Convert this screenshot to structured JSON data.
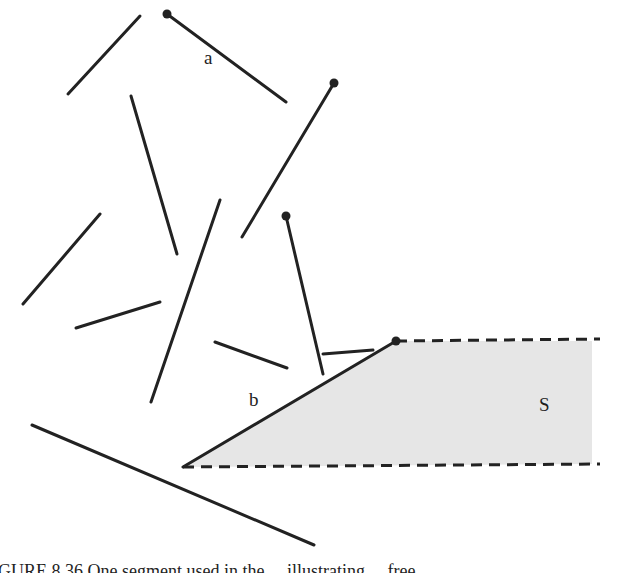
{
  "figure": {
    "labels": {
      "a": "a",
      "b": "b",
      "s": "S"
    },
    "caption": "GURE 8.36   One segment used in the ... illustrating ... free ...",
    "colors": {
      "stroke": "#222222",
      "region_fill": "#e6e6e6",
      "background": "#ffffff"
    },
    "segments": [
      {
        "id": "seg-1",
        "x1": 68,
        "y1": 94,
        "x2": 140,
        "y2": 16
      },
      {
        "id": "seg-a",
        "x1": 167,
        "y1": 14,
        "x2": 286,
        "y2": 102,
        "endpoint_dot": [
          167,
          14
        ]
      },
      {
        "id": "seg-3",
        "x1": 334,
        "y1": 83,
        "x2": 242,
        "y2": 237,
        "endpoint_dot": [
          334,
          83
        ]
      },
      {
        "id": "seg-4",
        "x1": 131,
        "y1": 96,
        "x2": 177,
        "y2": 254
      },
      {
        "id": "seg-5",
        "x1": 23,
        "y1": 304,
        "x2": 100,
        "y2": 214
      },
      {
        "id": "seg-6",
        "x1": 76,
        "y1": 328,
        "x2": 160,
        "y2": 302
      },
      {
        "id": "seg-7",
        "x1": 220,
        "y1": 200,
        "x2": 151,
        "y2": 402
      },
      {
        "id": "seg-8",
        "x1": 286,
        "y1": 216,
        "x2": 323,
        "y2": 374,
        "endpoint_dot": [
          286,
          216
        ]
      },
      {
        "id": "seg-9",
        "x1": 215,
        "y1": 342,
        "x2": 287,
        "y2": 368
      },
      {
        "id": "seg-10",
        "x1": 323,
        "y1": 354,
        "x2": 373,
        "y2": 350
      },
      {
        "id": "seg-b",
        "x1": 183,
        "y1": 467,
        "x2": 396,
        "y2": 341,
        "endpoint_dot": [
          396,
          341
        ]
      },
      {
        "id": "seg-12",
        "x1": 32,
        "y1": 425,
        "x2": 314,
        "y2": 545
      }
    ],
    "region_s": {
      "polygon": [
        [
          183,
          467
        ],
        [
          396,
          341
        ],
        [
          592,
          341
        ],
        [
          592,
          464
        ]
      ],
      "dashed_top": [
        396,
        341,
        600,
        339
      ],
      "dashed_bottom": [
        183,
        467,
        600,
        464
      ]
    }
  }
}
